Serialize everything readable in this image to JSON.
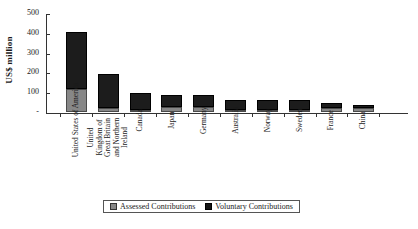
{
  "chart_data": {
    "type": "bar",
    "title": "",
    "subtitle": "",
    "xlabel": "",
    "ylabel": "US$ million",
    "ylim": [
      0,
      500
    ],
    "yticks": [
      "-",
      "100",
      "200",
      "300",
      "400",
      "500"
    ],
    "ytick_values": [
      0,
      100,
      200,
      300,
      400,
      500
    ],
    "grid": false,
    "stacked": true,
    "legend_position": "bottom-center",
    "categories": [
      "United States of America",
      "United Kingdom of Great Britain and Northern Ireland",
      "Canada",
      "Japan",
      "Germany",
      "Australia",
      "Norway",
      "Sweden",
      "France",
      "China"
    ],
    "series": [
      {
        "name": "Assessed Contributions",
        "color": "#878787",
        "values": [
          115,
          20,
          8,
          25,
          25,
          12,
          10,
          12,
          18,
          18
        ]
      },
      {
        "name": "Voluntary Contributions",
        "color": "#141414",
        "values": [
          290,
          170,
          87,
          60,
          60,
          50,
          52,
          48,
          27,
          17
        ]
      }
    ],
    "totals": [
      405,
      190,
      95,
      85,
      85,
      62,
      62,
      60,
      45,
      35
    ]
  },
  "legend": {
    "entries": [
      {
        "label": "Assessed Contributions",
        "swatch": "assessed-swatch"
      },
      {
        "label": "Voluntary Contributions",
        "swatch": "voluntary-swatch"
      }
    ]
  }
}
